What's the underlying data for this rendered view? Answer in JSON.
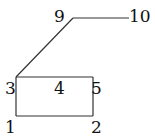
{
  "diagram": {
    "type": "graph",
    "nodes": [
      {
        "id": "1",
        "label": "1",
        "x": 16,
        "y": 116
      },
      {
        "id": "2",
        "label": "2",
        "x": 93,
        "y": 116
      },
      {
        "id": "3",
        "label": "3",
        "x": 16,
        "y": 77
      },
      {
        "id": "4",
        "label": "4",
        "x": 55,
        "y": 77
      },
      {
        "id": "5",
        "label": "5",
        "x": 93,
        "y": 77
      },
      {
        "id": "9",
        "label": "9",
        "x": 73,
        "y": 18
      },
      {
        "id": "10",
        "label": "10",
        "x": 129,
        "y": 18
      }
    ],
    "edges": [
      [
        "1",
        "2"
      ],
      [
        "1",
        "3"
      ],
      [
        "2",
        "5"
      ],
      [
        "3",
        "5"
      ],
      [
        "3",
        "9"
      ],
      [
        "9",
        "10"
      ]
    ],
    "labels": {
      "n1": "1",
      "n2": "2",
      "n3": "3",
      "n4": "4",
      "n5": "5",
      "n9": "9",
      "n10": "10"
    }
  }
}
